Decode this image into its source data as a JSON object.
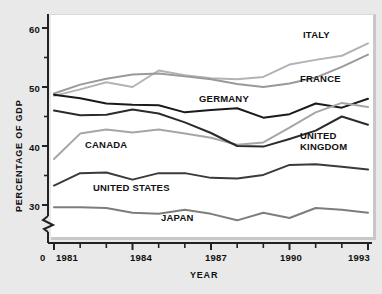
{
  "chart_data": {
    "type": "line",
    "title": "",
    "xlabel": "YEAR",
    "ylabel": "PERCENTAGE OF GDP",
    "xlim": [
      1981,
      1993
    ],
    "ylim": [
      28,
      62
    ],
    "grid": false,
    "legend_position": "inline-annotations",
    "axis_break": true,
    "axis_break_note": "y-axis broken between 0 and ~28",
    "x": [
      1981,
      1982,
      1983,
      1984,
      1985,
      1986,
      1987,
      1988,
      1989,
      1990,
      1991,
      1992,
      1993
    ],
    "xticks": [
      1981,
      1982,
      1983,
      1984,
      1985,
      1986,
      1987,
      1988,
      1989,
      1990,
      1991,
      1992,
      1993
    ],
    "xticklabels": [
      "1981",
      "",
      "",
      "1984",
      "",
      "",
      "1987",
      "",
      "",
      "1990",
      "",
      "",
      "1993"
    ],
    "yticks": [
      30,
      35,
      40,
      45,
      50,
      55,
      60
    ],
    "yticklabels": [
      "30",
      "",
      "40",
      "",
      "50",
      "",
      "60"
    ],
    "origin_label": "0",
    "series": [
      {
        "name": "ITALY",
        "color": "#b3b3b3",
        "values": [
          48.5,
          49.6,
          50.8,
          50.0,
          52.8,
          52.0,
          51.5,
          51.3,
          51.7,
          53.8,
          54.6,
          55.3,
          57.4
        ]
      },
      {
        "name": "FRANCE",
        "color": "#9a9a9a",
        "values": [
          48.9,
          50.4,
          51.4,
          52.1,
          52.3,
          51.8,
          51.3,
          50.5,
          50.0,
          50.6,
          51.6,
          53.4,
          55.5
        ]
      },
      {
        "name": "GERMANY",
        "color": "#1a1a1a",
        "values": [
          48.7,
          48.1,
          47.2,
          47.0,
          46.9,
          45.7,
          46.1,
          46.4,
          44.8,
          45.4,
          47.2,
          46.5,
          48.0
        ]
      },
      {
        "name": "CANADA",
        "color": "#a6a6a6",
        "values": [
          37.8,
          42.1,
          42.8,
          42.3,
          42.8,
          42.1,
          41.4,
          40.2,
          40.6,
          43.1,
          45.7,
          47.3,
          46.6
        ]
      },
      {
        "name": "UNITED KINGDOM",
        "color": "#2b2b2b",
        "values": [
          46.0,
          45.2,
          45.3,
          46.2,
          45.5,
          44.0,
          42.2,
          40.0,
          39.9,
          41.2,
          42.6,
          45.0,
          43.6
        ]
      },
      {
        "name": "UNITED STATES",
        "color": "#3a3a3a",
        "values": [
          33.3,
          35.4,
          35.5,
          34.3,
          35.4,
          35.4,
          34.6,
          34.5,
          35.1,
          36.8,
          36.9,
          36.5,
          36.0
        ]
      },
      {
        "name": "JAPAN",
        "color": "#7d7d7d",
        "values": [
          29.6,
          29.6,
          29.5,
          28.7,
          28.5,
          29.2,
          28.5,
          27.4,
          28.7,
          27.8,
          29.5,
          29.2,
          28.7
        ]
      }
    ],
    "annotations": [
      {
        "text": "ITALY",
        "x_px": 303,
        "y_px": 29
      },
      {
        "text": "FRANCE",
        "x_px": 300,
        "y_px": 73
      },
      {
        "text": "GERMANY",
        "x_px": 199,
        "y_px": 93
      },
      {
        "text": "CANADA",
        "x_px": 85,
        "y_px": 139
      },
      {
        "text": "UNITED",
        "x_px": 300,
        "y_px": 130
      },
      {
        "text": "KINGDOM",
        "x_px": 300,
        "y_px": 141
      },
      {
        "text": "UNITED STATES",
        "x_px": 93,
        "y_px": 182
      },
      {
        "text": "JAPAN",
        "x_px": 161,
        "y_px": 212
      }
    ]
  },
  "axes": {
    "y_title": "PERCENTAGE OF GDP",
    "x_title": "YEAR",
    "y_ticks": [
      {
        "label": "60",
        "value": 60
      },
      {
        "label": "50",
        "value": 50
      },
      {
        "label": "40",
        "value": 40
      },
      {
        "label": "30",
        "value": 30
      }
    ],
    "x_ticks": [
      {
        "label": "1981",
        "value": 1981
      },
      {
        "label": "1984",
        "value": 1984
      },
      {
        "label": "1987",
        "value": 1987
      },
      {
        "label": "1990",
        "value": 1990
      },
      {
        "label": "1993",
        "value": 1993
      }
    ],
    "origin": "0"
  },
  "labels": {
    "italy": "ITALY",
    "france": "FRANCE",
    "germany": "GERMANY",
    "canada": "CANADA",
    "united_line1": "UNITED",
    "united_line2": "KINGDOM",
    "united_states": "UNITED STATES",
    "japan": "JAPAN",
    "y60": "60",
    "y50": "50",
    "y40": "40",
    "y30": "30",
    "x1981": "1981",
    "x1984": "1984",
    "x1987": "1987",
    "x1990": "1990",
    "x1993": "1993",
    "zero": "0"
  }
}
